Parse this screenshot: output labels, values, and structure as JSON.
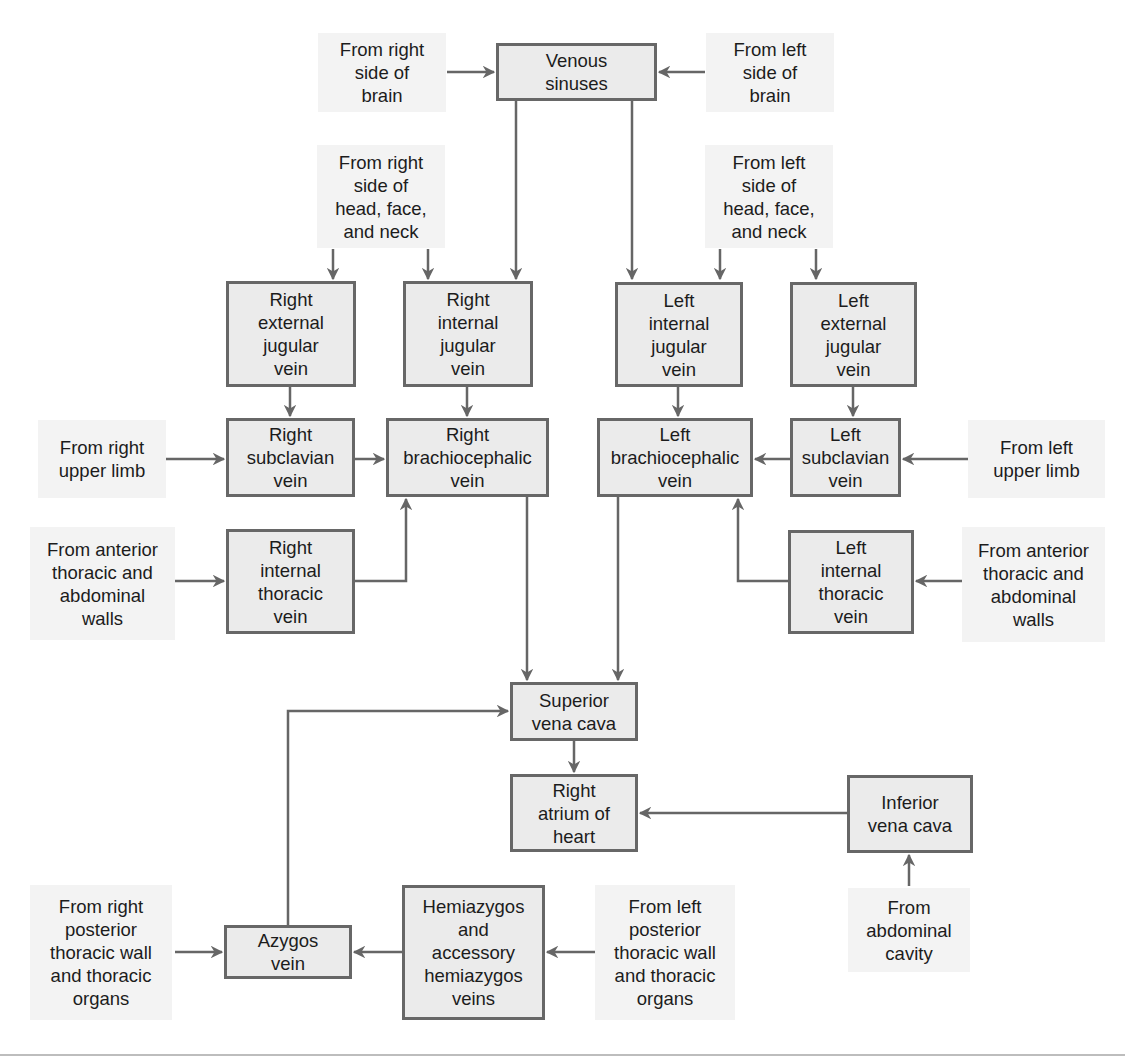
{
  "diagram": {
    "colors": {
      "vein_fill": "#ebebeb",
      "vein_border": "#676767",
      "source_fill": "#f3f3f3",
      "arrow": "#666666",
      "text": "#1c1c1c"
    },
    "veins": {
      "venous_sinuses": "Venous\nsinuses",
      "right_external_jugular": "Right\nexternal\njugular\nvein",
      "right_internal_jugular": "Right\ninternal\njugular\nvein",
      "left_internal_jugular": "Left\ninternal\njugular\nvein",
      "left_external_jugular": "Left\nexternal\njugular\nvein",
      "right_subclavian": "Right\nsubclavian\nvein",
      "right_brachiocephalic": "Right\nbrachiocephalic\nvein",
      "left_brachiocephalic": "Left\nbrachiocephalic\nvein",
      "left_subclavian": "Left\nsubclavian\nvein",
      "right_internal_thoracic": "Right\ninternal\nthoracic\nvein",
      "left_internal_thoracic": "Left\ninternal\nthoracic\nvein",
      "superior_vena_cava": "Superior\nvena cava",
      "right_atrium": "Right\natrium of\nheart",
      "inferior_vena_cava": "Inferior\nvena cava",
      "azygos": "Azygos\nvein",
      "hemiazygos": "Hemiazygos\nand\naccessory\nhemiazygos\nveins"
    },
    "sources": {
      "right_brain": "From right\nside of\nbrain",
      "left_brain": "From left\nside of\nbrain",
      "right_head": "From right\nside of\nhead, face,\nand neck",
      "left_head": "From left\nside of\nhead, face,\nand neck",
      "right_upper_limb": "From right\nupper limb",
      "left_upper_limb": "From left\nupper limb",
      "right_anterior_walls": "From anterior\nthoracic and\nabdominal\nwalls",
      "left_anterior_walls": "From anterior\nthoracic and\nabdominal\nwalls",
      "abdominal_cavity": "From\nabdominal\ncavity",
      "right_posterior": "From right\nposterior\nthoracic wall\nand thoracic\norgans",
      "left_posterior": "From left\nposterior\nthoracic wall\nand thoracic\norgans"
    }
  }
}
